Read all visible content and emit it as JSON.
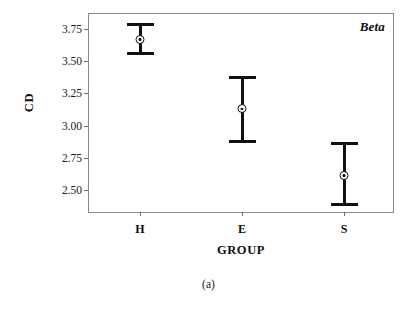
{
  "figure": {
    "caption": "(a)",
    "panel_label": "Beta"
  },
  "chart_data": {
    "type": "scatter",
    "title": "",
    "subtitle": "",
    "xlabel": "GROUP",
    "ylabel": "CD",
    "categories": [
      "H",
      "E",
      "S"
    ],
    "values": [
      3.67,
      3.13,
      2.61
    ],
    "error_low": [
      3.55,
      2.86,
      2.37
    ],
    "error_high": [
      3.8,
      3.39,
      2.87
    ],
    "series": [
      {
        "name": "Beta",
        "points": [
          {
            "category": "H",
            "mean": 3.67,
            "lower": 3.55,
            "upper": 3.8
          },
          {
            "category": "E",
            "mean": 3.13,
            "lower": 2.86,
            "upper": 3.39
          },
          {
            "category": "S",
            "mean": 2.61,
            "lower": 2.37,
            "upper": 2.87
          }
        ]
      }
    ],
    "ylim": [
      2.31,
      3.87
    ],
    "yticks": [
      3.75,
      3.5,
      3.25,
      3.0,
      2.75,
      2.5
    ],
    "ytick_labels": [
      "3.75",
      "3.50",
      "3.25",
      "3.00",
      "2.75",
      "2.50"
    ],
    "xticks": [
      "H",
      "E",
      "S"
    ],
    "grid": false,
    "legend": "none",
    "annotations": [
      "Beta"
    ],
    "marker": "circle-with-dot",
    "colors": {
      "data": "#101010",
      "frame": "#8a8a8a",
      "text": "#0d0d0d",
      "background": "#ffffff"
    }
  }
}
